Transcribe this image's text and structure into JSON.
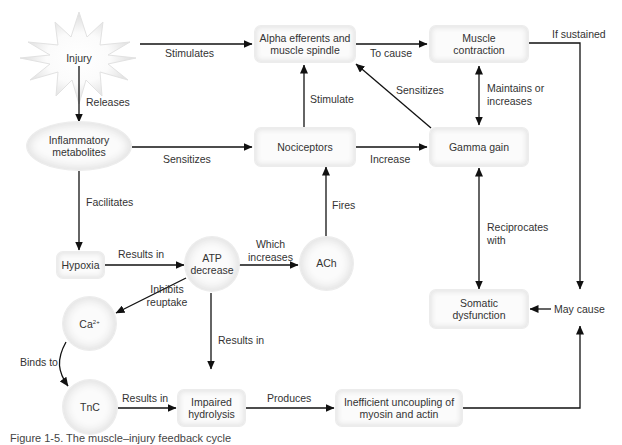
{
  "diagram": {
    "type": "concept-flow",
    "nodes": {
      "injury": "Injury",
      "alpha": "Alpha efferents and muscle spindle",
      "muscle": "Muscle contraction",
      "inflammatory": "Inflammatory metabolites",
      "nociceptors": "Nociceptors",
      "gamma": "Gamma gain",
      "hypoxia": "Hypoxia",
      "atp": "ATP decrease",
      "ach": "ACh",
      "ca": "Ca",
      "ca_sup": "2+",
      "somatic": "Somatic dysfunction",
      "tnc": "TnC",
      "impaired": "Impaired hydrolysis",
      "inefficient": "Inefficient uncoupling of myosin and actin"
    },
    "edges": {
      "injury_alpha": "Stimulates",
      "injury_inflammatory": "Releases",
      "alpha_muscle": "To cause",
      "muscle_somatic": "If sustained",
      "inflammatory_nociceptors": "Sensitizes",
      "nociceptors_alpha": "Stimulate",
      "gamma_alpha": "Sensitizes",
      "muscle_gamma": "Maintains or increases",
      "nociceptors_gamma": "Increase",
      "inflammatory_hypoxia": "Facilitates",
      "ach_nociceptors": "Fires",
      "hypoxia_atp": "Results in",
      "atp_ach": "Which increases",
      "gamma_somatic": "Reciprocates with",
      "atp_ca": "Inhibits reuptake",
      "atp_impaired": "Results in",
      "may_cause": "May cause",
      "ca_tnc": "Binds to",
      "tnc_impaired": "Results in",
      "impaired_inefficient": "Produces"
    }
  },
  "caption": "Figure 1-5. The muscle–injury feedback cycle"
}
